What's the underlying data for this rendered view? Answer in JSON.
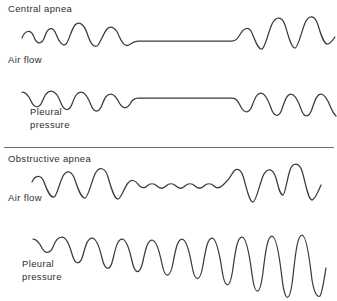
{
  "figure": {
    "background_color": "#ffffff",
    "line_color": "#3b3b3b",
    "divider_color": "#6e6e6e"
  },
  "labels": {
    "central_apnea": "Central apnea",
    "central_air_flow": "Air flow",
    "central_pleural_pressure": "Pleural\npressure",
    "obstructive_apnea": "Obstructive apnea",
    "obstructive_air_flow": "Air flow",
    "obstructive_pleural_pressure": "Pleural\npressure"
  },
  "chart_data": {
    "type": "line",
    "xlabel": "",
    "ylabel": "",
    "grid": false,
    "legend": "none",
    "panels": [
      {
        "name": "central-apnea-air-flow",
        "section": "Central apnea",
        "signal": "Air flow",
        "description": "Regular oscillating breaths, then a completely flat line during the apnea (no airflow effort), followed by resumed larger breaths.",
        "apnea_flat": true,
        "apnea_start_x": 130,
        "apnea_end_x": 238,
        "path": "M 22 38 C 25 30, 31 29, 34 37 C 37 45, 42 45, 45 36 C 48 27, 53 26, 56 34 C 59 42, 63 47, 66 44 C 69 41, 71 30, 75 25 C 79 21, 84 24, 87 33 C 90 42, 93 48, 97 46 C 100 44, 103 34, 107 29 C 111 25, 116 28, 119 36 C 122 43, 125 47, 129 45 C 132 43, 134 41, 138 41 L 232 41 C 236 41, 238 38, 241 33 C 244 28, 249 26, 252 33 C 255 40, 258 50, 262 49 C 265 48, 268 33, 272 24 C 276 16, 282 16, 285 25 C 288 34, 291 48, 295 48 C 298 48, 301 33, 305 23 C 309 14, 315 15, 318 25 C 321 35, 324 45, 328 44 C 331 43, 333 40, 335 37"
      },
      {
        "name": "central-apnea-pleural-pressure",
        "section": "Central apnea",
        "signal": "Pleural pressure",
        "description": "Downward negative-pressure swings that cease entirely during the apnea, leaving a flat baseline, then resume with deeper swings.",
        "apnea_flat": true,
        "apnea_start_x": 130,
        "apnea_end_x": 238,
        "path": "M 22 17 C 25 17, 28 19, 31 26 C 34 33, 39 34, 42 27 C 45 20, 47 16, 51 16 C 55 16, 58 20, 61 28 C 64 36, 69 37, 72 29 C 75 21, 77 17, 81 17 C 85 17, 88 22, 91 30 C 94 38, 99 38, 102 30 C 105 22, 107 19, 111 19 C 114 19, 117 23, 120 29 C 123 34, 127 34, 130 29 C 132 25, 134 23, 138 23 L 232 23 C 236 23, 238 26, 241 32 C 244 38, 249 39, 252 31 C 255 23, 257 18, 261 18 C 265 18, 268 24, 271 33 C 274 42, 279 43, 282 34 C 285 25, 287 19, 291 19 C 295 19, 298 25, 301 34 C 304 43, 309 43, 312 34 C 315 25, 317 19, 321 19 C 325 19, 328 25, 331 33 C 333 38, 335 40, 336 41"
      },
      {
        "name": "obstructive-apnea-air-flow",
        "section": "Obstructive apnea",
        "signal": "Air flow",
        "description": "Breaths become small low-amplitude ripples during the obstruction rather than flat, then large recovery breaths follow.",
        "apnea_flat": false,
        "apnea_start_x": 128,
        "apnea_end_x": 228,
        "path": "M 32 32 C 35 25, 41 24, 44 32 C 47 40, 50 48, 54 47 C 57 46, 59 34, 63 26 C 67 19, 72 21, 75 30 C 78 39, 81 48, 85 48 C 88 48, 91 33, 95 24 C 99 16, 105 17, 108 27 C 111 37, 114 49, 118 49 C 121 49, 124 38, 128 33 C 131 29, 135 30, 138 34 C 141 38, 144 39, 147 36 C 150 33, 154 33, 157 36 C 160 39, 163 39, 166 36 C 169 33, 173 33, 176 36 C 179 39, 182 39, 185 36 C 188 33, 192 33, 195 36 C 198 39, 201 39, 204 36 C 207 33, 211 33, 214 36 C 217 39, 220 38, 223 35 C 226 32, 229 30, 232 24 C 235 18, 240 17, 243 26 C 246 35, 249 52, 253 52 C 256 52, 259 36, 263 26 C 267 17, 273 18, 276 28 C 278 36, 280 45, 283 45 C 285 45, 287 29, 290 20 C 293 12, 299 12, 302 21 C 305 30, 308 50, 312 50 C 315 50, 318 42, 321 35"
      },
      {
        "name": "obstructive-apnea-pleural-pressure",
        "section": "Obstructive apnea",
        "signal": "Pleural pressure",
        "description": "Progressively deeper and narrower negative pressure swings showing escalating respiratory effort against the obstruction.",
        "apnea_flat": false,
        "escalating_effort": true,
        "path": "M 33 19 C 36 19, 39 22, 42 28 C 45 34, 50 34, 53 27 C 56 20, 58 17, 62 17 C 66 17, 69 23, 72 34 C 75 45, 80 46, 83 35 C 86 24, 88 18, 92 18 C 96 18, 99 25, 102 38 C 105 51, 110 52, 113 39 C 116 26, 118 19, 122 19 C 126 19, 129 27, 132 41 C 135 55, 140 55, 143 41 C 146 27, 148 20, 152 20 C 156 20, 159 29, 162 44 C 165 59, 170 59, 173 43 C 176 27, 178 19, 182 19 C 186 19, 189 29, 192 46 C 195 63, 200 63, 203 45 C 206 27, 208 18, 212 18 C 216 18, 219 30, 222 50 C 225 70, 230 70, 233 48 C 236 26, 238 17, 242 17 C 246 17, 249 31, 252 54 C 255 77, 260 77, 263 52 C 266 27, 268 16, 272 16 C 276 16, 279 32, 282 58 C 285 84, 290 84, 293 56 C 296 28, 298 15, 302 15 C 306 15, 309 33, 312 60 C 314 72, 317 78, 320 76 C 322 74, 324 60, 326 48"
      }
    ]
  }
}
